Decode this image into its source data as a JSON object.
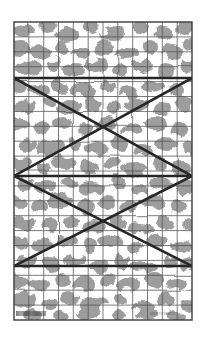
{
  "figure": {
    "kind": "scanned-diagram",
    "canvas": {
      "width": 215,
      "height": 340,
      "background": "#ffffff"
    },
    "frame": {
      "name": "plate-border",
      "x": 14,
      "y": 22,
      "width": 178,
      "height": 298,
      "stroke": "#3a3a3a",
      "stroke_width": 1.4
    },
    "texture": {
      "name": "camouflage-mottle",
      "description": "irregular blotchy grey shapes on white, halftone scan appearance",
      "fill": "#9a9a9a",
      "background": "#ffffff",
      "coverage_percent": 46
    },
    "grid": {
      "name": "survey-grid",
      "columns": 12,
      "rows": 20,
      "cell_width": 14.8,
      "cell_height": 14.9,
      "stroke": "#4e4e4e",
      "stroke_width": 0.85,
      "visible": true
    },
    "overlay": {
      "name": "zigzag-polyline",
      "stroke": "#262626",
      "stroke_width": 2.6,
      "horizontals": [
        {
          "label": "upper-chord",
          "y": 78,
          "x1": 14,
          "x2": 192
        },
        {
          "label": "middle-chord",
          "y": 176,
          "x1": 14,
          "x2": 192
        },
        {
          "label": "lower-chord",
          "y": 266,
          "x1": 14,
          "x2": 192
        }
      ],
      "diagonals": [
        {
          "label": "d1",
          "x1": 14,
          "y1": 78,
          "x2": 192,
          "y2": 176
        },
        {
          "label": "d2",
          "x1": 192,
          "y1": 78,
          "x2": 14,
          "y2": 176
        },
        {
          "label": "d3",
          "x1": 14,
          "y1": 176,
          "x2": 192,
          "y2": 266
        },
        {
          "label": "d4",
          "x1": 192,
          "y1": 176,
          "x2": 14,
          "y2": 266
        }
      ],
      "crossings": [
        {
          "label": "upper-crossing",
          "x": 100,
          "y": 127
        },
        {
          "label": "lower-crossing",
          "x": 100,
          "y": 221
        }
      ]
    },
    "caption": {
      "name": "scale-bar-smudge",
      "text": "",
      "legible": false
    }
  },
  "colors": {
    "paper": "#ffffff",
    "mottle": "#9a9a9a",
    "grid_line": "#4e4e4e",
    "frame_line": "#3a3a3a",
    "overlay_line": "#262626"
  }
}
